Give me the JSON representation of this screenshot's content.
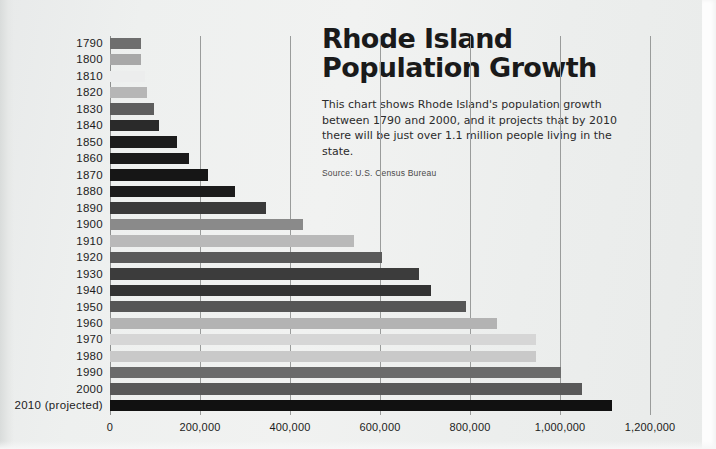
{
  "title": {
    "line1": "Rhode Island",
    "line2": "Population Growth"
  },
  "deck": {
    "line1": "This chart shows Rhode Island's population growth",
    "line2": "between 1790 and 2000, and it projects that by 2010",
    "line3": "there will be just over 1.1 million people living in the state."
  },
  "source": "Source: U.S. Census Bureau",
  "chart_data": {
    "type": "bar",
    "orientation": "horizontal",
    "title": "Rhode Island Population Growth",
    "xlabel": "",
    "ylabel": "",
    "xlim": [
      0,
      1200000
    ],
    "grid": true,
    "legend": false,
    "xticks": [
      "0",
      "200,000",
      "400,000",
      "600,000",
      "800,000",
      "1,000,000",
      "1,200,000"
    ],
    "xtick_values": [
      0,
      200000,
      400000,
      600000,
      800000,
      1000000,
      1200000
    ],
    "categories": [
      "1790",
      "1800",
      "1810",
      "1820",
      "1830",
      "1840",
      "1850",
      "1860",
      "1870",
      "1880",
      "1890",
      "1900",
      "1910",
      "1920",
      "1930",
      "1940",
      "1950",
      "1960",
      "1970",
      "1980",
      "1990",
      "2000",
      "2010 (projected)"
    ],
    "values": [
      69000,
      69000,
      77000,
      83000,
      97000,
      109000,
      148000,
      175000,
      217000,
      277000,
      346000,
      429000,
      543000,
      604000,
      687000,
      713000,
      792000,
      859000,
      947000,
      947000,
      1003000,
      1048000,
      1116000
    ],
    "bar_colors": [
      "#6e6e6e",
      "#a8a8a8",
      "#eceded",
      "#b6b6b6",
      "#5e5e5e",
      "#2a2a2a",
      "#1c1c1c",
      "#1a1a1a",
      "#161616",
      "#1b1b1b",
      "#3a3a3a",
      "#8a8a8a",
      "#b9b9b9",
      "#5a5a5a",
      "#3c3c3c",
      "#333333",
      "#565656",
      "#b3b3b3",
      "#d6d6d6",
      "#c9c9c9",
      "#6b6b6b",
      "#595959",
      "#111111"
    ]
  }
}
